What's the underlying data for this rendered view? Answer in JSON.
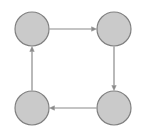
{
  "figure": {
    "kind": "directed-graph-diagram",
    "title": "Directed cycle graph with four nodes",
    "width": 147,
    "height": 135,
    "background_color": "#ffffff"
  },
  "style": {
    "node_fill": "#cacaca",
    "node_stroke": "#808080",
    "node_stroke_width": 1.2,
    "node_radius": 17,
    "edge_color": "#8a8a8a",
    "edge_width": 1.2,
    "arrow_head_length": 5,
    "arrow_head_width": 4.5
  },
  "chart_data": {
    "type": "graph",
    "title": "Directed cycle graph with four nodes",
    "directed": true,
    "layout": "square",
    "node_count": 4,
    "edge_count": 4,
    "nodes": [
      {
        "id": "n1",
        "label": "",
        "position": "top-left",
        "cx": 32,
        "cy": 29,
        "r": 17
      },
      {
        "id": "n2",
        "label": "",
        "position": "top-right",
        "cx": 114,
        "cy": 29,
        "r": 17
      },
      {
        "id": "n3",
        "label": "",
        "position": "bottom-right",
        "cx": 114,
        "cy": 108,
        "r": 17
      },
      {
        "id": "n4",
        "label": "",
        "position": "bottom-left",
        "cx": 32,
        "cy": 108,
        "r": 17
      }
    ],
    "edges": [
      {
        "id": "e1",
        "source": "n1",
        "target": "n2",
        "direction": "right",
        "arrow": "target"
      },
      {
        "id": "e2",
        "source": "n2",
        "target": "n3",
        "direction": "down",
        "arrow": "target"
      },
      {
        "id": "e3",
        "source": "n3",
        "target": "n4",
        "direction": "left",
        "arrow": "target"
      },
      {
        "id": "e4",
        "source": "n4",
        "target": "n1",
        "direction": "up",
        "arrow": "target"
      }
    ],
    "cycle_order": [
      "n1",
      "n2",
      "n3",
      "n4",
      "n1"
    ],
    "cycle_orientation": "clockwise",
    "legend": [],
    "annotations": []
  }
}
